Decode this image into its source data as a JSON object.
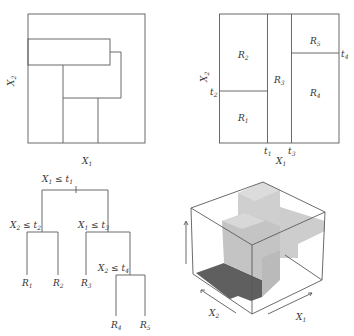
{
  "panels": {
    "top_left": {
      "title": "Non-binary-split partition",
      "xlabel": "X",
      "xlabel_sub": "1",
      "ylabel": "X",
      "ylabel_sub": "2"
    },
    "top_right": {
      "xlabel": "X",
      "xlabel_sub": "1",
      "ylabel": "X",
      "ylabel_sub": "2",
      "regions": [
        {
          "name": "R",
          "sub": "1"
        },
        {
          "name": "R",
          "sub": "2"
        },
        {
          "name": "R",
          "sub": "3"
        },
        {
          "name": "R",
          "sub": "4"
        },
        {
          "name": "R",
          "sub": "5"
        }
      ],
      "thresholds": [
        {
          "name": "t",
          "sub": "1",
          "axis": "X1"
        },
        {
          "name": "t",
          "sub": "2",
          "axis": "X2"
        },
        {
          "name": "t",
          "sub": "3",
          "axis": "X1"
        },
        {
          "name": "t",
          "sub": "4",
          "axis": "X2"
        }
      ]
    },
    "bottom_left": {
      "tree": {
        "root": {
          "var": "X",
          "var_sub": "1",
          "op": " ≤ ",
          "thr": "t",
          "thr_sub": "1"
        },
        "left_split": {
          "var": "X",
          "var_sub": "2",
          "op": " ≤ ",
          "thr": "t",
          "thr_sub": "2"
        },
        "right_split": {
          "var": "X",
          "var_sub": "1",
          "op": " ≤ ",
          "thr": "t",
          "thr_sub": "3"
        },
        "deep_split": {
          "var": "X",
          "var_sub": "2",
          "op": " ≤ ",
          "thr": "t",
          "thr_sub": "4"
        },
        "leaves": [
          {
            "name": "R",
            "sub": "1"
          },
          {
            "name": "R",
            "sub": "2"
          },
          {
            "name": "R",
            "sub": "3"
          },
          {
            "name": "R",
            "sub": "4"
          },
          {
            "name": "R",
            "sub": "5"
          }
        ]
      }
    },
    "bottom_right": {
      "xlabel": "X",
      "xlabel_sub": "1",
      "ylabel": "X",
      "ylabel_sub": "2",
      "colors": {
        "dark": "#5c5c5c",
        "light": "#d6d6d6",
        "mid": "#bdbdbd"
      }
    }
  }
}
